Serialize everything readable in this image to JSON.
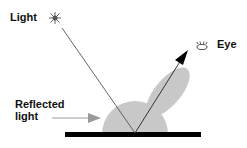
{
  "diagram": {
    "labels": {
      "light": "Light",
      "eye": "Eye",
      "reflected_line1": "Reflected",
      "reflected_line2": "light"
    },
    "icons": {
      "light_source": "star-burst-icon",
      "viewer": "eye-icon"
    },
    "colors": {
      "lobe": "#c8c8c8",
      "surface": "#000000",
      "incident_ray": "#555555",
      "reflected_ray": "#222222",
      "label_arrow": "#9a9a9a"
    }
  }
}
